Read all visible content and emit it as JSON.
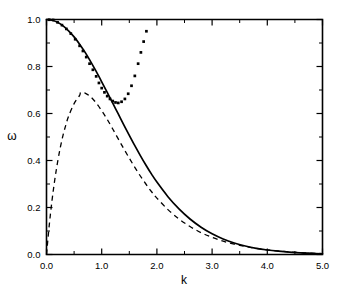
{
  "figure": {
    "background_color": "#ffffff",
    "foreground_color": "#000000"
  },
  "axes": {
    "x": {
      "label": "k",
      "min": 0.0,
      "max": 5.0,
      "ticks": [
        "0.0",
        "1.0",
        "2.0",
        "3.0",
        "4.0",
        "5.0"
      ],
      "tick_values": [
        0.0,
        1.0,
        2.0,
        3.0,
        4.0,
        5.0
      ],
      "minor_ticks_per_interval": 1
    },
    "y": {
      "label": "ω",
      "min": 0.0,
      "max": 1.0,
      "ticks": [
        "0.0",
        "0.2",
        "0.4",
        "0.6",
        "0.8",
        "1.0"
      ],
      "tick_values": [
        0.0,
        0.2,
        0.4,
        0.6,
        0.8,
        1.0
      ],
      "minor_ticks_per_interval": 1
    }
  },
  "chart_data": {
    "type": "line",
    "title": "",
    "xlabel": "k",
    "ylabel": "ω",
    "xlim": [
      0.0,
      5.0
    ],
    "ylim": [
      0.0,
      1.0
    ],
    "grid": false,
    "legend": "none",
    "series": [
      {
        "name": "solid-curve",
        "style": "solid",
        "color": "#000000",
        "x": [
          0.0,
          0.1,
          0.2,
          0.3,
          0.4,
          0.5,
          0.6,
          0.7,
          0.8,
          0.9,
          1.0,
          1.1,
          1.2,
          1.3,
          1.4,
          1.5,
          1.6,
          1.7,
          1.8,
          1.9,
          2.0,
          2.2,
          2.4,
          2.6,
          2.8,
          3.0,
          3.2,
          3.4,
          3.6,
          3.8,
          4.0,
          4.2,
          4.4,
          4.6,
          4.8,
          5.0
        ],
        "y": [
          1.0,
          0.997,
          0.988,
          0.973,
          0.952,
          0.926,
          0.895,
          0.86,
          0.821,
          0.779,
          0.735,
          0.69,
          0.644,
          0.598,
          0.552,
          0.507,
          0.463,
          0.421,
          0.381,
          0.343,
          0.308,
          0.246,
          0.194,
          0.151,
          0.116,
          0.088,
          0.066,
          0.049,
          0.036,
          0.026,
          0.019,
          0.014,
          0.01,
          0.007,
          0.005,
          0.003
        ]
      },
      {
        "name": "dashed-curve",
        "style": "dashed",
        "color": "#000000",
        "x": [
          0.0,
          0.05,
          0.1,
          0.15,
          0.2,
          0.25,
          0.3,
          0.35,
          0.4,
          0.5,
          0.6,
          0.62,
          0.7,
          0.8,
          0.9,
          1.0,
          1.1,
          1.2,
          1.3,
          1.4,
          1.5,
          1.6,
          1.7,
          1.8,
          1.9,
          2.0,
          2.2,
          2.4,
          2.6,
          2.8,
          3.0,
          3.2,
          3.4,
          3.6,
          3.8,
          4.0,
          4.4,
          4.8,
          5.0
        ],
        "y": [
          0.0,
          0.125,
          0.23,
          0.318,
          0.392,
          0.455,
          0.508,
          0.551,
          0.588,
          0.642,
          0.677,
          0.69,
          0.687,
          0.671,
          0.645,
          0.612,
          0.575,
          0.534,
          0.492,
          0.45,
          0.41,
          0.371,
          0.334,
          0.3,
          0.268,
          0.24,
          0.191,
          0.151,
          0.119,
          0.093,
          0.073,
          0.057,
          0.044,
          0.034,
          0.026,
          0.02,
          0.011,
          0.006,
          0.004
        ]
      },
      {
        "name": "dotted-points",
        "style": "points",
        "marker": "square",
        "color": "#000000",
        "x": [
          0.05,
          0.12,
          0.2,
          0.28,
          0.36,
          0.44,
          0.52,
          0.6,
          0.66,
          0.72,
          0.78,
          0.84,
          0.9,
          0.95,
          1.0,
          1.05,
          1.1,
          1.15,
          1.2,
          1.25,
          1.3,
          1.36,
          1.42,
          1.48,
          1.54,
          1.6,
          1.66,
          1.71,
          1.76,
          1.81
        ],
        "y": [
          0.999,
          0.998,
          0.988,
          0.976,
          0.96,
          0.94,
          0.916,
          0.888,
          0.866,
          0.84,
          0.812,
          0.786,
          0.758,
          0.73,
          0.708,
          0.69,
          0.674,
          0.662,
          0.653,
          0.647,
          0.645,
          0.65,
          0.662,
          0.684,
          0.718,
          0.76,
          0.812,
          0.86,
          0.906,
          0.95
        ]
      }
    ]
  }
}
